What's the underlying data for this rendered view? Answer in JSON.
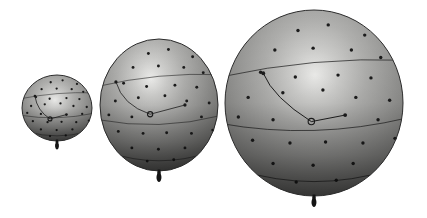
{
  "figure": {
    "canvas": {
      "width": 427,
      "height": 218,
      "background": "#ffffff"
    },
    "colors": {
      "outline": "#2c2c2c",
      "lat_line": "#262626",
      "curve_line": "#1f1f1f",
      "dot": "#1c1c1c",
      "ring": "#1d1d1d",
      "knot": "#141414",
      "gradient_stops": [
        {
          "offset": 0.0,
          "color": "#f1f1ef"
        },
        {
          "offset": 0.18,
          "color": "#d0d0ce"
        },
        {
          "offset": 0.38,
          "color": "#b1b1af"
        },
        {
          "offset": 0.58,
          "color": "#999997"
        },
        {
          "offset": 0.78,
          "color": "#80807e"
        },
        {
          "offset": 1.0,
          "color": "#646462"
        }
      ],
      "bottom_shade_stops": [
        {
          "offset": 0.0,
          "color": "rgba(0,0,0,0)"
        },
        {
          "offset": 0.5,
          "color": "rgba(0,0,0,0.05)"
        },
        {
          "offset": 0.78,
          "color": "rgba(0,0,0,0.28)"
        },
        {
          "offset": 1.0,
          "color": "rgba(0,0,0,0.55)"
        }
      ]
    },
    "shared": {
      "dot_pattern": [
        [
          -0.18,
          -0.78
        ],
        [
          0.16,
          -0.84
        ],
        [
          0.57,
          -0.73
        ],
        [
          -0.44,
          -0.57
        ],
        [
          -0.01,
          -0.59
        ],
        [
          0.42,
          -0.57
        ],
        [
          0.75,
          -0.49
        ],
        [
          -0.6,
          -0.33
        ],
        [
          -0.21,
          -0.28
        ],
        [
          0.27,
          -0.3
        ],
        [
          0.64,
          -0.27
        ],
        [
          -0.74,
          -0.06
        ],
        [
          -0.35,
          -0.11
        ],
        [
          0.1,
          -0.14
        ],
        [
          0.47,
          -0.06
        ],
        [
          0.85,
          -0.03
        ],
        [
          -0.85,
          0.15
        ],
        [
          -0.46,
          0.18
        ],
        [
          0.72,
          0.18
        ],
        [
          -0.69,
          0.4
        ],
        [
          -0.27,
          0.43
        ],
        [
          0.13,
          0.42
        ],
        [
          0.55,
          0.43
        ],
        [
          0.91,
          0.38
        ],
        [
          -0.46,
          0.65
        ],
        [
          -0.01,
          0.67
        ],
        [
          0.44,
          0.65
        ],
        [
          -0.2,
          0.85
        ],
        [
          0.25,
          0.83
        ]
      ],
      "lat_lines": [
        {
          "x1": -1.05,
          "y1": -0.28,
          "cx": 0,
          "cy": -0.5,
          "x2": 1.05,
          "y2": -0.46
        },
        {
          "x1": -1.05,
          "y1": 0.22,
          "cx": 0,
          "cy": 0.4,
          "x2": 1.05,
          "y2": 0.16
        },
        {
          "x1": -0.85,
          "y1": 0.72,
          "cx": 0,
          "cy": 0.97,
          "x2": 0.85,
          "y2": 0.72
        }
      ]
    },
    "balloons": [
      {
        "id": "small",
        "cx": 57,
        "cy": 108,
        "rx": 35,
        "ry": 33,
        "dot_r": 1.15,
        "line_w": 0.7,
        "highlight_fx": 0.47,
        "highlight_fy": 0.38,
        "marker": {
          "x": -0.2,
          "y": 0.33,
          "r": 2.0
        },
        "curve": {
          "sx": -0.63,
          "sy": -0.36,
          "cx": -0.57,
          "cy": 0.08,
          "ex": 0.27,
          "ey": 0.2
        },
        "knot_scale": 0.8
      },
      {
        "id": "medium",
        "cx": 159,
        "cy": 105,
        "rx": 59,
        "ry": 66,
        "dot_r": 1.45,
        "line_w": 0.8,
        "highlight_fx": 0.43,
        "highlight_fy": 0.3,
        "marker": {
          "x": -0.15,
          "y": 0.14,
          "r": 2.6
        },
        "curve": {
          "sx": -0.73,
          "sy": -0.35,
          "cx": -0.62,
          "cy": 0.0,
          "ex": 0.44,
          "ey": 0.0
        },
        "knot_scale": 1.0
      },
      {
        "id": "large",
        "cx": 314,
        "cy": 103,
        "rx": 89,
        "ry": 93,
        "dot_r": 1.7,
        "line_w": 1.0,
        "highlight_fx": 0.505,
        "highlight_fy": 0.35,
        "marker": {
          "x": -0.03,
          "y": 0.2,
          "r": 3.2
        },
        "curve": {
          "sx": -0.57,
          "sy": -0.32,
          "cx": -0.46,
          "cy": -0.06,
          "ex": 0.35,
          "ey": 0.13
        },
        "knot_scale": 1.0
      }
    ]
  }
}
